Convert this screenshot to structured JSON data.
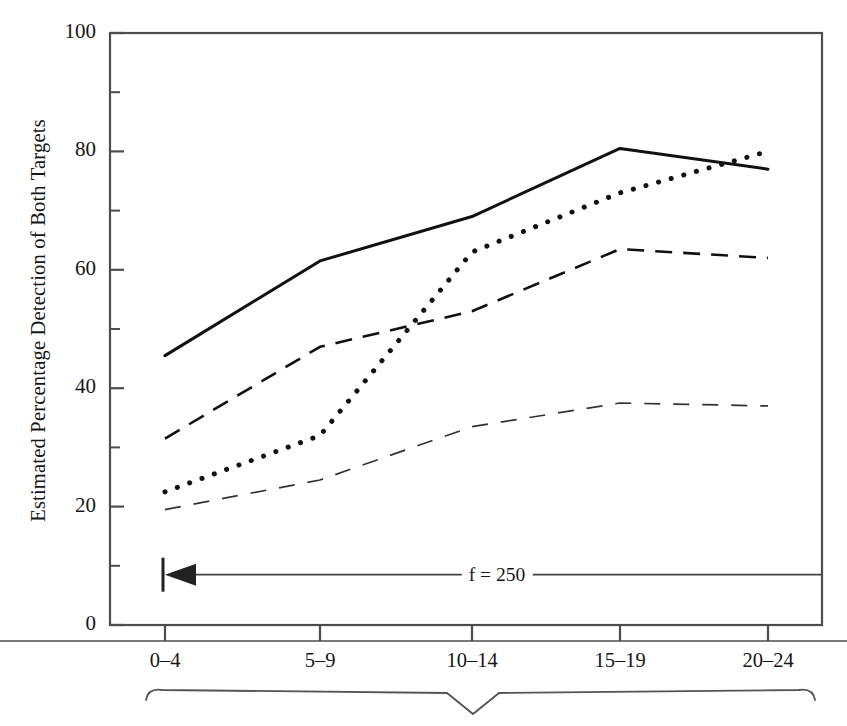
{
  "chart_data": {
    "type": "line",
    "title": "",
    "xlabel": "",
    "ylabel": "Estimated Percentage Detection of Both Targets",
    "categories": [
      "0–4",
      "5–9",
      "10–14",
      "15–19",
      "20–24"
    ],
    "ylim": [
      0,
      100
    ],
    "ytick_labels": [
      "0",
      "20",
      "40",
      "60",
      "80",
      "100"
    ],
    "ytick_values": [
      0,
      20,
      40,
      60,
      80,
      100
    ],
    "yminor_values": [
      10,
      30,
      50,
      70,
      90
    ],
    "grid": false,
    "legend": "none",
    "series": [
      {
        "name": "solid",
        "style": "solid",
        "width": 3.0,
        "color": "#111111",
        "values": [
          45.5,
          61.5,
          69.0,
          80.5,
          77.0
        ]
      },
      {
        "name": "dotted",
        "style": "dotted",
        "width": 5.0,
        "color": "#111111",
        "values": [
          22.5,
          32.0,
          63.0,
          73.0,
          80.0
        ]
      },
      {
        "name": "dashed",
        "style": "dashed",
        "width": 2.6,
        "color": "#111111",
        "values": [
          31.5,
          47.0,
          53.0,
          63.5,
          62.0
        ]
      },
      {
        "name": "thin-dashed",
        "style": "thin-dashed",
        "width": 1.7,
        "color": "#333333",
        "values": [
          19.5,
          24.5,
          33.5,
          37.5,
          37.0
        ]
      }
    ],
    "annotations": [
      {
        "name": "f-annotation",
        "text": "f = 250",
        "y_value": 8.5,
        "arrow": "left"
      }
    ],
    "bottom_brace": {
      "present": true,
      "direction": "down"
    }
  },
  "colors": {
    "frame": "#4d4d4d",
    "ink": "#111111",
    "light_ink": "#333333",
    "background": "#ffffff"
  }
}
